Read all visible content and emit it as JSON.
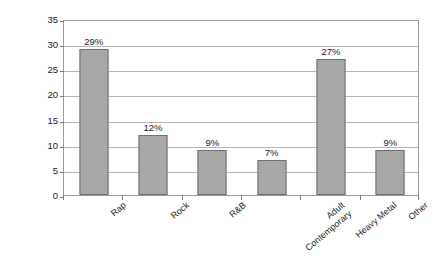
{
  "chart_data": {
    "type": "bar",
    "title": "",
    "subtitle": "",
    "xlabel": "",
    "ylabel": "% featuring violence",
    "categories": [
      "Rap",
      "Rock",
      "R&B",
      "Adult Contemporary",
      "Heavy Metal",
      "Other"
    ],
    "category_lines": [
      [
        "Rap"
      ],
      [
        "Rock"
      ],
      [
        "R&B"
      ],
      [
        "Adult",
        "Contemporary"
      ],
      [
        "Heavy Metal"
      ],
      [
        "Other"
      ]
    ],
    "values": [
      29,
      12,
      9,
      7,
      27,
      9
    ],
    "data_labels": [
      "29%",
      "12%",
      "9%",
      "7%",
      "27%",
      "9%"
    ],
    "ylim": [
      0,
      35
    ],
    "ytick_values": [
      0,
      5,
      10,
      15,
      20,
      25,
      30,
      35
    ],
    "ytick_labels": [
      "0",
      "5",
      "10",
      "15",
      "20",
      "25",
      "30",
      "35"
    ],
    "grid": "horizontal",
    "legend": "none",
    "bar_color": "#a8a8a8",
    "bar_border_color": "#6e6e6e",
    "gridline_color": "#b4b4b4",
    "axis_color": "#9a9a9a",
    "background_color": "#ffffff",
    "label_rotation_deg": -40
  }
}
